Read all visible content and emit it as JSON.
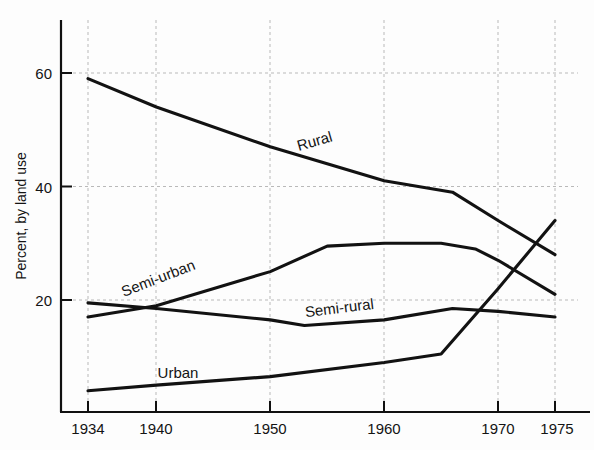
{
  "chart_data": {
    "type": "line",
    "title": "",
    "xlabel": "",
    "ylabel": "Percent, by land use",
    "xlim": [
      1934,
      1975
    ],
    "ylim": [
      0,
      65
    ],
    "grid": true,
    "legend_position": "inline-labels",
    "xtick_labels": [
      "1934",
      "1940",
      "1950",
      "1960",
      "1970",
      "1975"
    ],
    "xticks": [
      1934,
      1940,
      1950,
      1960,
      1970,
      1975
    ],
    "ytick_labels": [
      "20",
      "40",
      "60"
    ],
    "yticks": [
      20,
      40,
      60
    ],
    "series": [
      {
        "name": "Rural",
        "label": "Rural",
        "color": "#121212",
        "x": [
          1934,
          1940,
          1950,
          1960,
          1966,
          1970,
          1975
        ],
        "values": [
          59,
          54,
          47,
          41,
          39,
          34,
          28
        ]
      },
      {
        "name": "Semi-urban",
        "label": "Semi-urban",
        "color": "#121212",
        "x": [
          1934,
          1940,
          1950,
          1955,
          1960,
          1965,
          1968,
          1970,
          1975
        ],
        "values": [
          17,
          19,
          25,
          29.5,
          30,
          30,
          29,
          27,
          21
        ]
      },
      {
        "name": "Semi-rural",
        "label": "Semi-rural",
        "color": "#121212",
        "x": [
          1934,
          1940,
          1950,
          1953,
          1960,
          1966,
          1970,
          1975
        ],
        "values": [
          19.5,
          18.5,
          16.5,
          15.5,
          16.5,
          18.5,
          18,
          17
        ]
      },
      {
        "name": "Urban",
        "label": "Urban",
        "color": "#121212",
        "x": [
          1934,
          1940,
          1950,
          1960,
          1965,
          1970,
          1975
        ],
        "values": [
          4,
          5,
          6.5,
          9,
          10.5,
          22,
          34
        ]
      }
    ],
    "annotations": [
      {
        "text": "Rural",
        "x": 316,
        "y": 146,
        "rotation": -16
      },
      {
        "text": "Semi-urban",
        "x": 160,
        "y": 283,
        "rotation": -21
      },
      {
        "text": "Semi-rural",
        "x": 340,
        "y": 313,
        "rotation": -7
      },
      {
        "text": "Urban",
        "x": 178,
        "y": 378,
        "rotation": 0
      }
    ]
  }
}
